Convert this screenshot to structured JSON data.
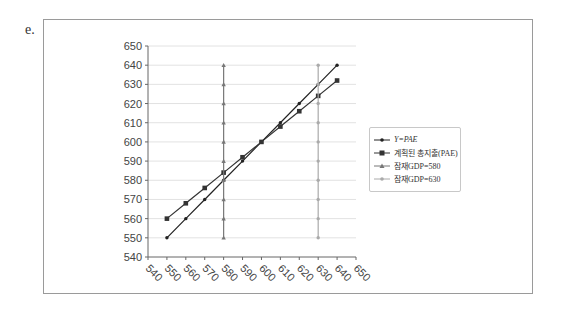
{
  "label": "e.",
  "chart_data": {
    "type": "line",
    "title": "",
    "xlabel": "",
    "ylabel": "",
    "xlim": [
      540,
      650
    ],
    "ylim": [
      540,
      650
    ],
    "x_ticks": [
      "540",
      "550",
      "560",
      "570",
      "580",
      "590",
      "600",
      "610",
      "620",
      "630",
      "640",
      "650"
    ],
    "y_ticks": [
      "540",
      "550",
      "560",
      "570",
      "580",
      "590",
      "600",
      "610",
      "620",
      "630",
      "640",
      "650"
    ],
    "grid": "horizontal",
    "legend_position": "right",
    "series": [
      {
        "name": "Y=PAE",
        "color": "#222222",
        "marker": "dot",
        "x": [
          550,
          560,
          570,
          580,
          590,
          600,
          610,
          620,
          630,
          640
        ],
        "y": [
          550,
          560,
          570,
          580,
          590,
          600,
          610,
          620,
          630,
          640
        ]
      },
      {
        "name": "계획된 총지출(PAE)",
        "color": "#333333",
        "marker": "square",
        "x": [
          550,
          560,
          570,
          580,
          590,
          600,
          610,
          620,
          630,
          640
        ],
        "y": [
          560,
          568,
          576,
          584,
          592,
          600,
          608,
          616,
          624,
          632
        ]
      },
      {
        "name": "잠재GDP=580",
        "color": "#777777",
        "marker": "triangle",
        "x": [
          580,
          580,
          580,
          580,
          580,
          580,
          580,
          580,
          580,
          580
        ],
        "y": [
          550,
          560,
          570,
          580,
          590,
          600,
          610,
          620,
          630,
          640
        ]
      },
      {
        "name": "잠재GDP=630",
        "color": "#aaaaaa",
        "marker": "dot",
        "x": [
          630,
          630,
          630,
          630,
          630,
          630,
          630,
          630,
          630,
          630
        ],
        "y": [
          550,
          560,
          570,
          580,
          590,
          600,
          610,
          620,
          630,
          640
        ]
      }
    ]
  },
  "legend": {
    "items": [
      {
        "label": "Y=PAE"
      },
      {
        "label": "계획된 총지출(PAE)"
      },
      {
        "label": "잠재GDP=580"
      },
      {
        "label": "잠재GDP=630"
      }
    ]
  }
}
